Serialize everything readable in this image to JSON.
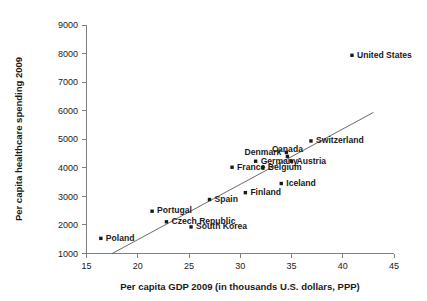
{
  "chart_data": {
    "type": "scatter",
    "title": "",
    "xlabel": "Per capita GDP 2009 (in thousands U.S. dollars, PPP)",
    "ylabel": "Per capita healthcare spending 2009",
    "xlim": [
      15,
      45
    ],
    "ylim": [
      1000,
      9000
    ],
    "xticks": [
      "15",
      "20",
      "25",
      "30",
      "35",
      "40",
      "45"
    ],
    "yticks": [
      "1000",
      "2000",
      "3000",
      "4000",
      "5000",
      "6000",
      "7000",
      "8000",
      "9000"
    ],
    "grid": false,
    "legend": "none",
    "marker_color": "#1a1a1a",
    "trend_color": "#5a5a5a",
    "axis_color": "#808080",
    "trendline": {
      "x_start": 17.5,
      "y_start": 1000,
      "x_end": 43.0,
      "y_end": 5940
    },
    "points": [
      {
        "label": "Poland",
        "x": 16.4,
        "y": 1530,
        "label_pos": "right"
      },
      {
        "label": "Portugal",
        "x": 21.4,
        "y": 2480,
        "label_pos": "right"
      },
      {
        "label": "Czech Republic",
        "x": 22.8,
        "y": 2110,
        "label_pos": "right"
      },
      {
        "label": "South Korea",
        "x": 25.2,
        "y": 1930,
        "label_pos": "right"
      },
      {
        "label": "Spain",
        "x": 27.0,
        "y": 2890,
        "label_pos": "right"
      },
      {
        "label": "Finland",
        "x": 30.5,
        "y": 3130,
        "label_pos": "right"
      },
      {
        "label": "Iceland",
        "x": 34.0,
        "y": 3450,
        "label_pos": "right"
      },
      {
        "label": "France",
        "x": 29.2,
        "y": 4020,
        "label_pos": "right"
      },
      {
        "label": "Belgium",
        "x": 32.2,
        "y": 4010,
        "label_pos": "right"
      },
      {
        "label": "Germany",
        "x": 31.5,
        "y": 4230,
        "label_pos": "right"
      },
      {
        "label": "Austria",
        "x": 35.0,
        "y": 4230,
        "label_pos": "right"
      },
      {
        "label": "Canada",
        "x": 34.6,
        "y": 4400,
        "label_pos": "above"
      },
      {
        "label": "Denmark",
        "x": 34.5,
        "y": 4540,
        "label_pos": "left"
      },
      {
        "label": "Switzerland",
        "x": 36.9,
        "y": 4940,
        "label_pos": "right"
      },
      {
        "label": "United States",
        "x": 40.9,
        "y": 7940,
        "label_pos": "right"
      }
    ]
  }
}
